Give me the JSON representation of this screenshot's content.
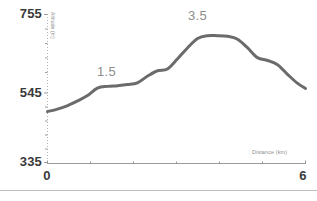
{
  "chart_data": {
    "type": "line",
    "title": "",
    "xlabel": "Distance (km)",
    "ylabel": "Altitude (m)",
    "xlim": [
      0,
      6
    ],
    "ylim": [
      335,
      755
    ],
    "grid": false,
    "legend": null,
    "x_ticks": [
      "0",
      "6"
    ],
    "y_ticks": [
      "755",
      "545",
      "335"
    ],
    "annotations": [
      {
        "text": "1.5",
        "x": 1.35,
        "y": 583
      },
      {
        "text": "3.5",
        "x": 3.55,
        "y": 712
      }
    ],
    "series": [
      {
        "name": "Elevation profile",
        "color": "#6b6b6b",
        "x": [
          0.0,
          0.23,
          0.47,
          0.7,
          0.93,
          1.16,
          1.4,
          1.63,
          1.86,
          2.09,
          2.33,
          2.56,
          2.79,
          3.02,
          3.26,
          3.49,
          3.72,
          3.95,
          4.19,
          4.42,
          4.65,
          4.88,
          5.12,
          5.35,
          5.58,
          5.81,
          6.0
        ],
        "y": [
          480,
          487,
          497,
          510,
          525,
          546,
          551,
          553,
          556,
          561,
          580,
          595,
          600,
          628,
          660,
          686,
          694,
          694,
          692,
          684,
          660,
          632,
          624,
          612,
          585,
          560,
          545
        ]
      }
    ]
  },
  "labels": {
    "y_top": "755",
    "y_mid": "545",
    "y_bottom": "335",
    "x_left": "0",
    "x_right": "6",
    "x_axis_title": "Distance (km)",
    "y_axis_title": "Altitude (m)",
    "annotation_1": "1.5",
    "annotation_2": "3.5"
  },
  "colors": {
    "line": "#6b6b6b",
    "axis": "#9a9a9a",
    "tick_text": "#3a3a3a",
    "annotation_text": "#8d8d8d",
    "background": "#ffffff",
    "divider": "#bdbdbd"
  }
}
